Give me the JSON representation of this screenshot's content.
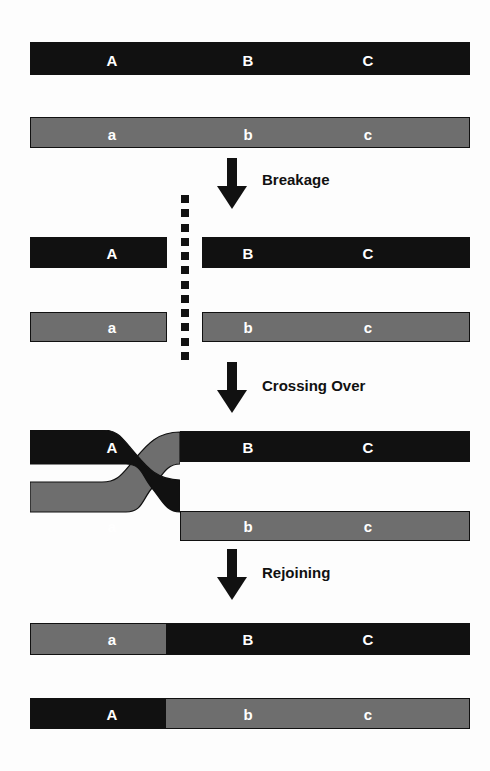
{
  "diagram": {
    "colors": {
      "maternal_black": "#111111",
      "paternal_gray": "#6e6e6e",
      "label_text": "#ffffff",
      "step_text": "#111111",
      "background": "#ffffff"
    },
    "loci": {
      "upper": [
        "A",
        "B",
        "C"
      ],
      "lower": [
        "a",
        "b",
        "c"
      ]
    },
    "stages": [
      {
        "id": "intact",
        "name": "intact-homologous-chromosomes",
        "chromosomes": [
          {
            "strand": "upper",
            "color": "black",
            "labels": [
              "A",
              "B",
              "C"
            ]
          },
          {
            "strand": "lower",
            "color": "gray",
            "labels": [
              "a",
              "b",
              "c"
            ]
          }
        ]
      },
      {
        "id": "breakage",
        "name": "broken-chromosomes",
        "chromosomes": [
          {
            "strand": "upper-left",
            "color": "black",
            "labels": [
              "A"
            ]
          },
          {
            "strand": "upper-right",
            "color": "black",
            "labels": [
              "B",
              "C"
            ]
          },
          {
            "strand": "lower-left",
            "color": "gray",
            "labels": [
              "a"
            ]
          },
          {
            "strand": "lower-right",
            "color": "gray",
            "labels": [
              "b",
              "c"
            ]
          }
        ]
      },
      {
        "id": "crossing-over",
        "name": "crossed-strands",
        "chromosomes": [
          {
            "strand": "upper-left",
            "color": "black",
            "labels": [
              "A"
            ]
          },
          {
            "strand": "upper-right",
            "color": "black",
            "labels": [
              "B",
              "C"
            ]
          },
          {
            "strand": "lower-left",
            "color": "gray",
            "labels": [
              "a"
            ]
          },
          {
            "strand": "lower-right",
            "color": "gray",
            "labels": [
              "b",
              "c"
            ]
          }
        ]
      },
      {
        "id": "rejoining",
        "name": "recombinant-chromosomes",
        "chromosomes": [
          {
            "strand": "upper",
            "segments": [
              "gray",
              "black"
            ],
            "labels": [
              "a",
              "B",
              "C"
            ]
          },
          {
            "strand": "lower",
            "segments": [
              "black",
              "gray"
            ],
            "labels": [
              "A",
              "b",
              "c"
            ]
          }
        ]
      }
    ],
    "steps": [
      {
        "id": "breakage",
        "label": "Breakage",
        "icon": "down-arrow-icon"
      },
      {
        "id": "crossing-over",
        "label": "Crossing Over",
        "icon": "down-arrow-icon"
      },
      {
        "id": "rejoining",
        "label": "Rejoining",
        "icon": "down-arrow-icon"
      }
    ],
    "break_line": {
      "name": "dotted-break-line",
      "dot_count": 12,
      "color": "#111111"
    }
  }
}
